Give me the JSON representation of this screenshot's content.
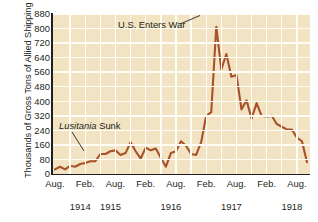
{
  "axis": {
    "ylabel": "Thousands of Gross Tons of Allied Shipping Lost",
    "yticks": [
      "880",
      "800",
      "720",
      "640",
      "560",
      "480",
      "400",
      "320",
      "240",
      "160",
      "80",
      "0"
    ],
    "xticks": [
      "Aug.",
      "Feb.",
      "Aug.",
      "Feb.",
      "Aug.",
      "Feb.",
      "Aug.",
      "Feb.",
      "Aug."
    ],
    "years": [
      "1914",
      "1915",
      "1916",
      "1917",
      "1918"
    ]
  },
  "annotations": {
    "war": "U.S. Enters War",
    "lusitania_italic": "Lusitania",
    "lusitania_plain": " Sunk"
  },
  "colors": {
    "plot_background": "#f2e4c2",
    "gridline": "#fffdf6",
    "line": "#a8512a",
    "axis": "#231f20",
    "text": "#231f20",
    "page_background": "#ffffff"
  },
  "chart_data": {
    "type": "line",
    "title": "",
    "xlabel": "",
    "ylabel": "Thousands of Gross Tons of Allied Shipping Lost",
    "ylim": [
      0,
      880
    ],
    "ytick_step": 80,
    "grid": true,
    "legend": "none",
    "x_tick_labels": [
      "Aug.",
      "Feb.",
      "Aug.",
      "Feb.",
      "Aug.",
      "Feb.",
      "Aug.",
      "Feb.",
      "Aug."
    ],
    "x_tick_months": [
      "Aug. 1914",
      "Feb. 1915",
      "Aug. 1915",
      "Feb. 1916",
      "Aug. 1916",
      "Feb. 1917",
      "Aug. 1917",
      "Feb. 1918",
      "Aug. 1918"
    ],
    "x_year_labels": [
      "1914",
      "1915",
      "1916",
      "1917",
      "1918"
    ],
    "series": [
      {
        "name": "Allied shipping lost",
        "x": [
          "Aug. 1914",
          "Sep. 1914",
          "Oct. 1914",
          "Nov. 1914",
          "Dec. 1914",
          "Jan. 1915",
          "Feb. 1915",
          "Mar. 1915",
          "Apr. 1915",
          "May 1915",
          "Jun. 1915",
          "Jul. 1915",
          "Aug. 1915",
          "Sep. 1915",
          "Oct. 1915",
          "Nov. 1915",
          "Dec. 1915",
          "Jan. 1916",
          "Feb. 1916",
          "Mar. 1916",
          "Apr. 1916",
          "May 1916",
          "Jun. 1916",
          "Jul. 1916",
          "Aug. 1916",
          "Sep. 1916",
          "Oct. 1916",
          "Nov. 1916",
          "Dec. 1916",
          "Jan. 1917",
          "Feb. 1917",
          "Mar. 1917",
          "Apr. 1917",
          "May 1917",
          "Jun. 1917",
          "Jul. 1917",
          "Aug. 1917",
          "Sep. 1917",
          "Oct. 1917",
          "Nov. 1917",
          "Dec. 1917",
          "Jan. 1918",
          "Feb. 1918",
          "Mar. 1918",
          "Apr. 1918",
          "May 1918",
          "Jun. 1918",
          "Jul. 1918",
          "Aug. 1918",
          "Sep. 1918",
          "Oct. 1918"
        ],
        "values": [
          25,
          40,
          25,
          45,
          40,
          55,
          60,
          70,
          70,
          110,
          110,
          125,
          130,
          105,
          115,
          175,
          125,
          85,
          145,
          130,
          140,
          90,
          40,
          115,
          125,
          180,
          155,
          110,
          105,
          175,
          320,
          340,
          810,
          575,
          660,
          535,
          545,
          355,
          405,
          305,
          390,
          320,
          315,
          320,
          275,
          260,
          245,
          245,
          200,
          180,
          65
        ]
      }
    ],
    "annotations": [
      {
        "text": "U.S. Enters War",
        "points_to": "Apr. 1917",
        "value": 810
      },
      {
        "text": "Lusitania Sunk",
        "points_to": "May 1915",
        "value": 110
      }
    ]
  }
}
